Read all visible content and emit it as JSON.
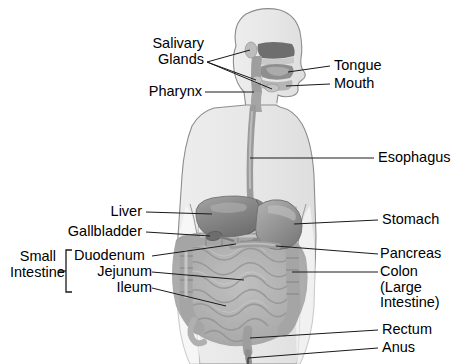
{
  "diagram": {
    "view": "anterior torso with sagittal head section",
    "colors": {
      "background": "#ffffff",
      "body_fill": "#e9e9e9",
      "body_outline": "#8d8d8d",
      "organ_dark": "#7e7e7e",
      "organ_mid": "#9a9a9a",
      "organ_light": "#b9b9b9",
      "intestine": "#a8a8a8",
      "leader_line": "#1a1a1a",
      "text": "#000000"
    }
  },
  "labels": {
    "left": [
      {
        "id": "salivary-glands",
        "line1": "Salivary",
        "line2": "Glands"
      },
      {
        "id": "pharynx",
        "line1": "Pharynx"
      },
      {
        "id": "liver",
        "line1": "Liver"
      },
      {
        "id": "gallbladder",
        "line1": "Gallbladder"
      },
      {
        "id": "duodenum",
        "line1": "Duodenum"
      },
      {
        "id": "jejunum",
        "line1": "Jejunum"
      },
      {
        "id": "ileum",
        "line1": "Ileum"
      }
    ],
    "group": {
      "id": "small-intestine",
      "line1": "Small",
      "line2": "Intestine",
      "members": [
        "Duodenum",
        "Jejunum",
        "Ileum"
      ]
    },
    "right": [
      {
        "id": "tongue",
        "line1": "Tongue"
      },
      {
        "id": "mouth",
        "line1": "Mouth"
      },
      {
        "id": "esophagus",
        "line1": "Esophagus"
      },
      {
        "id": "stomach",
        "line1": "Stomach"
      },
      {
        "id": "pancreas",
        "line1": "Pancreas"
      },
      {
        "id": "colon",
        "line1": "Colon",
        "line2": "(Large",
        "line3": "Intestine)"
      },
      {
        "id": "rectum",
        "line1": "Rectum"
      },
      {
        "id": "anus",
        "line1": "Anus"
      }
    ]
  }
}
